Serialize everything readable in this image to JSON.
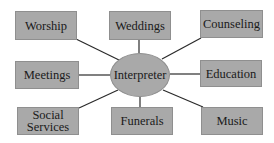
{
  "diagram": {
    "type": "hub-and-spoke",
    "center": {
      "label": "Interpreter"
    },
    "nodes": [
      {
        "id": "worship",
        "label": "Worship"
      },
      {
        "id": "weddings",
        "label": "Weddings"
      },
      {
        "id": "counseling",
        "label": "Counseling"
      },
      {
        "id": "meetings",
        "label": "Meetings"
      },
      {
        "id": "education",
        "label": "Education"
      },
      {
        "id": "social-services",
        "label": "Social Services",
        "lines": [
          "Social",
          "Services"
        ]
      },
      {
        "id": "funerals",
        "label": "Funerals"
      },
      {
        "id": "music",
        "label": "Music"
      }
    ],
    "colors": {
      "box_fill": "#a9a9a9",
      "line": "#2a2a2a",
      "text": "#1a1a1a"
    }
  }
}
